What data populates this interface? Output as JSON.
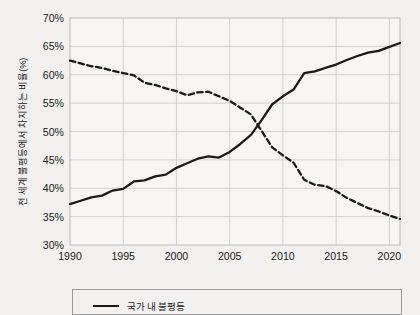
{
  "chart_data": {
    "type": "line",
    "title": "",
    "xlabel": "",
    "ylabel": "전 세계 불평등에서 차지하는 비율(%)",
    "xlim": [
      1990,
      2021
    ],
    "ylim": [
      30,
      70
    ],
    "ytick_labels": [
      "70%",
      "65%",
      "60%",
      "55%",
      "50%",
      "45%",
      "40%",
      "35%",
      "30%"
    ],
    "ytick_values": [
      70,
      65,
      60,
      55,
      50,
      45,
      40,
      35,
      30
    ],
    "xtick_labels": [
      "1990",
      "1995",
      "2000",
      "2005",
      "2010",
      "2015",
      "2020"
    ],
    "xtick_values": [
      1990,
      1995,
      2000,
      2005,
      2010,
      2015,
      2020
    ],
    "grid": true,
    "legend_position": "bottom",
    "legend": [
      "국가 내 불평등"
    ],
    "x": [
      1990,
      1991,
      1992,
      1993,
      1994,
      1995,
      1996,
      1997,
      1998,
      1999,
      2000,
      2001,
      2002,
      2003,
      2004,
      2005,
      2006,
      2007,
      2008,
      2009,
      2010,
      2011,
      2012,
      2013,
      2014,
      2015,
      2016,
      2017,
      2018,
      2019,
      2020,
      2021
    ],
    "series": [
      {
        "name": "국가 내 불평등",
        "style": "solid",
        "color": "#1a1a1a",
        "values": [
          37.2,
          37.8,
          38.4,
          38.7,
          39.6,
          39.9,
          41.2,
          41.4,
          42.1,
          42.4,
          43.6,
          44.4,
          45.2,
          45.6,
          45.4,
          46.4,
          47.8,
          49.4,
          52.0,
          54.8,
          56.2,
          57.4,
          60.3,
          60.6,
          61.2,
          61.8,
          62.6,
          63.3,
          63.9,
          64.2,
          64.9,
          65.6
        ]
      },
      {
        "name": "국가 간 불평등",
        "style": "dashed",
        "color": "#1a1a1a",
        "values": [
          62.5,
          62.0,
          61.5,
          61.2,
          60.7,
          60.3,
          59.9,
          58.6,
          58.2,
          57.6,
          57.1,
          56.4,
          56.9,
          57.0,
          56.2,
          55.4,
          54.2,
          53.0,
          50.1,
          47.2,
          45.8,
          44.5,
          41.5,
          40.6,
          40.4,
          39.5,
          38.3,
          37.4,
          36.5,
          35.9,
          35.2,
          34.6
        ]
      }
    ]
  }
}
